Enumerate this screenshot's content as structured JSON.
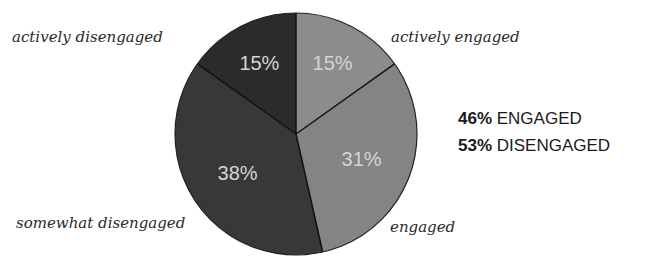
{
  "chart_data": {
    "type": "pie",
    "title": "",
    "slices": [
      {
        "label": "actively engaged",
        "value": 15,
        "display": "15%",
        "color": "#8c8c8c"
      },
      {
        "label": "engaged",
        "value": 31,
        "display": "31%",
        "color": "#848484"
      },
      {
        "label": "somewhat disengaged",
        "value": 38,
        "display": "38%",
        "color": "#383838"
      },
      {
        "label": "actively disengaged",
        "value": 15,
        "display": "15%",
        "color": "#2b2b2b"
      }
    ],
    "start_angle": "top, clockwise",
    "annotations": [
      {
        "value": "46%",
        "text": "ENGAGED"
      },
      {
        "value": "53%",
        "text": "DISENGAGED"
      }
    ]
  },
  "labels": {
    "actively_disengaged": "actively disengaged",
    "actively_engaged": "actively engaged",
    "somewhat_disengaged": "somewhat disengaged",
    "engaged": "engaged"
  },
  "summary": {
    "engaged_value": "46%",
    "engaged_text": " ENGAGED",
    "disengaged_value": "53%",
    "disengaged_text": " DISENGAGED"
  }
}
